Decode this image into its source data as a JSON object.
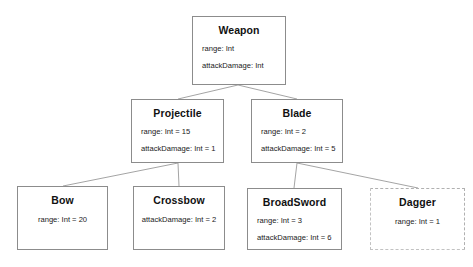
{
  "diagram": {
    "type": "uml-class-hierarchy",
    "background_color": "#ffffff",
    "border_color": "#8c8c8c",
    "edge_color": "#9a9a9a",
    "nodes": [
      {
        "id": "weapon",
        "title": "Weapon",
        "attributes": [
          "range: Int",
          "attackDamage: Int"
        ],
        "align": "left",
        "border": "solid",
        "x": 192,
        "y": 16,
        "w": 94,
        "h": 69
      },
      {
        "id": "projectile",
        "title": "Projectile",
        "attributes": [
          "range: Int = 15",
          "attackDamage: Int = 1"
        ],
        "align": "left",
        "border": "solid",
        "x": 131,
        "y": 99,
        "w": 93,
        "h": 64
      },
      {
        "id": "blade",
        "title": "Blade",
        "attributes": [
          "range: Int = 2",
          "attackDamage: Int = 5"
        ],
        "align": "left",
        "border": "solid",
        "x": 251,
        "y": 99,
        "w": 92,
        "h": 64
      },
      {
        "id": "bow",
        "title": "Bow",
        "attributes": [
          "range: Int = 20"
        ],
        "align": "center",
        "border": "solid",
        "x": 17,
        "y": 186,
        "w": 91,
        "h": 64
      },
      {
        "id": "crossbow",
        "title": "Crossbow",
        "attributes": [
          "attackDamage: Int = 2"
        ],
        "align": "center",
        "border": "solid",
        "x": 133,
        "y": 186,
        "w": 92,
        "h": 64
      },
      {
        "id": "broadsword",
        "title": "BroadSword",
        "attributes": [
          "range: Int = 3",
          "attackDamage: Int = 6"
        ],
        "align": "left",
        "border": "solid",
        "x": 247,
        "y": 188,
        "w": 95,
        "h": 62
      },
      {
        "id": "dagger",
        "title": "Dagger",
        "attributes": [
          "range: Int = 1"
        ],
        "align": "center",
        "border": "dashed",
        "x": 370,
        "y": 188,
        "w": 95,
        "h": 62
      }
    ],
    "edges": [
      {
        "from": "weapon",
        "to": "projectile",
        "x1": 238,
        "y1": 85,
        "x2": 178,
        "y2": 99
      },
      {
        "from": "weapon",
        "to": "blade",
        "x1": 238,
        "y1": 85,
        "x2": 297,
        "y2": 99
      },
      {
        "from": "projectile",
        "to": "bow",
        "x1": 178,
        "y1": 163,
        "x2": 63,
        "y2": 186
      },
      {
        "from": "projectile",
        "to": "crossbow",
        "x1": 178,
        "y1": 163,
        "x2": 179,
        "y2": 186
      },
      {
        "from": "blade",
        "to": "broadsword",
        "x1": 297,
        "y1": 163,
        "x2": 294,
        "y2": 188
      },
      {
        "from": "blade",
        "to": "dagger",
        "x1": 297,
        "y1": 163,
        "x2": 418,
        "y2": 188
      }
    ]
  }
}
